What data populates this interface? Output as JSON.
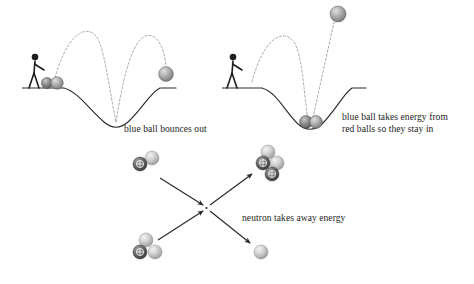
{
  "figure": {
    "background_color": "#ffffff",
    "width": 474,
    "height": 284
  },
  "panels": {
    "left": {
      "name": "blue-ball-bounces-out",
      "caption": "blue ball bounces out",
      "description": "A person pushes two balls into a potential well; the blue ball gains energy and bounces out of the well.",
      "balls_in_well": 2,
      "escaped_balls": 1
    },
    "right": {
      "name": "blue-ball-takes-energy",
      "caption_line1": "blue ball takes energy from",
      "caption_line2": "red balls so they stay in",
      "description": "A person pushes balls into a potential well; the blue ball carries away the energy so the red balls remain trapped.",
      "balls_in_well": 2,
      "escaped_balls": 1
    },
    "bottom": {
      "name": "fusion-reaction",
      "caption": "neutron takes away energy",
      "description": "Deuterium and tritium nuclei collide and fuse into a helium nucleus plus a free neutron.",
      "reactants": [
        {
          "label": "deuterium",
          "protons": 1,
          "neutrons": 1
        },
        {
          "label": "tritium",
          "protons": 1,
          "neutrons": 2
        }
      ],
      "products": [
        {
          "label": "helium",
          "protons": 2,
          "neutrons": 2
        },
        {
          "label": "neutron",
          "protons": 0,
          "neutrons": 1
        }
      ]
    }
  },
  "colors": {
    "line": "#2b2b2b",
    "trajectory": "#8a8a8a",
    "proton_dark": "#5a5a5a",
    "neutron_light": "#cfcfcf",
    "text": "#1c1c1c"
  },
  "symbols": {
    "proton_charge": "+"
  }
}
